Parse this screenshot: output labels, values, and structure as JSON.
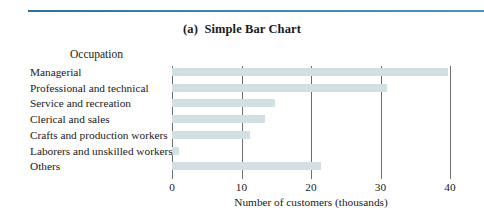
{
  "figure": {
    "title": "(a)  Simple Bar Chart",
    "rule_color": "#3a7ca5",
    "bar_color": "#d3e0e3",
    "axis_color": "#6a6f74",
    "background": "#ffffff"
  },
  "chart_data": {
    "type": "bar",
    "orientation": "horizontal",
    "title": "(a)  Simple Bar Chart",
    "xlabel": "Number of customers (thousands)",
    "ylabel": "Occupation",
    "categories": [
      "Managerial",
      "Professional and technical",
      "Service and recreation",
      "Clerical and sales",
      "Crafts and production workers",
      "Laborers and unskilled workers",
      "Others"
    ],
    "values": [
      39.7,
      31.0,
      14.8,
      13.4,
      11.2,
      1.0,
      21.5
    ],
    "xlim": [
      0,
      40
    ],
    "xticks": [
      0,
      10,
      20,
      30,
      40
    ],
    "xtick_labels": [
      "0",
      "10",
      "20",
      "30",
      "40"
    ],
    "grid": "vertical-gridlines-at-xticks",
    "legend": "none"
  }
}
